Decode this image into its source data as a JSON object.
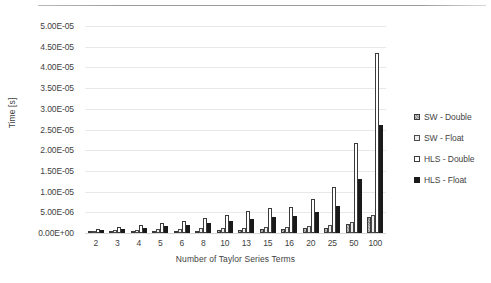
{
  "chart_data": {
    "type": "bar",
    "title": "",
    "xlabel": "Number of Taylor Series Terms",
    "ylabel": "Time [s]",
    "ylim": [
      0,
      5e-05
    ],
    "ytick_labels": [
      "5.00E-05",
      "4.50E-05",
      "4.00E-05",
      "3.50E-05",
      "3.00E-05",
      "2.50E-05",
      "2.00E-05",
      "1.50E-05",
      "1.00E-05",
      "5.00E-06",
      "0.00E+00"
    ],
    "ytick_values": [
      5e-05,
      4.5e-05,
      4e-05,
      3.5e-05,
      3e-05,
      2.5e-05,
      2e-05,
      1.5e-05,
      1e-05,
      5e-06,
      0
    ],
    "grid": true,
    "legend_position": "right",
    "categories": [
      "2",
      "3",
      "4",
      "5",
      "6",
      "8",
      "10",
      "13",
      "15",
      "16",
      "20",
      "25",
      "50",
      "100"
    ],
    "series": [
      {
        "name": "SW - Double",
        "color": "#8c8c8c",
        "values": [
          3e-07,
          3.5e-07,
          4e-07,
          4.5e-07,
          5e-07,
          6e-07,
          7e-07,
          8e-07,
          9e-07,
          9.5e-07,
          1.1e-06,
          1.3e-06,
          2.1e-06,
          3.8e-06
        ]
      },
      {
        "name": "SW - Float",
        "color": "#ededed",
        "values": [
          6e-07,
          7e-07,
          8e-07,
          9e-07,
          1e-06,
          1.1e-06,
          1.2e-06,
          1.3e-06,
          1.4e-06,
          1.5e-06,
          1.7e-06,
          1.9e-06,
          2.6e-06,
          4.3e-06
        ]
      },
      {
        "name": "HLS - Double",
        "color": "#ffffff",
        "values": [
          9e-07,
          1.4e-06,
          1.9e-06,
          2.5e-06,
          2.8e-06,
          3.6e-06,
          4.3e-06,
          5.3e-06,
          6e-06,
          6.4e-06,
          8.1e-06,
          1.12e-05,
          2.18e-05,
          4.35e-05
        ]
      },
      {
        "name": "HLS - Float",
        "color": "#1a1a1a",
        "values": [
          8e-07,
          1e-06,
          1.3e-06,
          1.6e-06,
          1.9e-06,
          2.4e-06,
          2.8e-06,
          3.3e-06,
          3.8e-06,
          4.1e-06,
          5e-06,
          6.6e-06,
          1.3e-05,
          2.6e-05
        ]
      }
    ]
  }
}
